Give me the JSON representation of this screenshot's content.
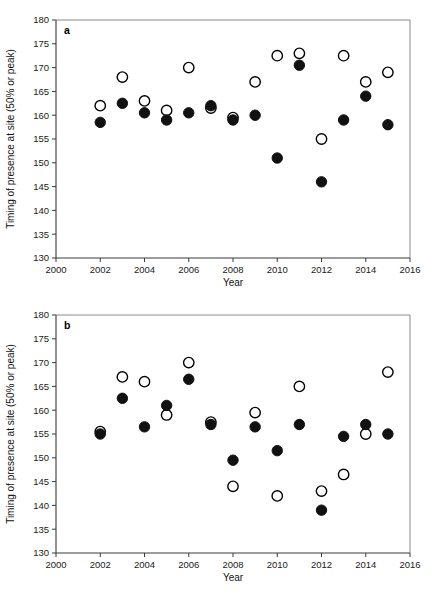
{
  "figure": {
    "width": 435,
    "height": 599,
    "background": "#ffffff",
    "marker_open_fill": "#ffffff",
    "marker_open_stroke": "#000000",
    "marker_filled_fill": "#111111"
  },
  "chart_data": [
    {
      "type": "scatter",
      "panel_label": "a",
      "title": "",
      "xlabel": "Year",
      "ylabel": "Timing of presence at site (50% or peak)",
      "xlim": [
        2000,
        2016
      ],
      "ylim": [
        130,
        180
      ],
      "xticks": [
        2000,
        2002,
        2004,
        2006,
        2008,
        2010,
        2012,
        2014,
        2016
      ],
      "yticks": [
        130,
        135,
        140,
        145,
        150,
        155,
        160,
        165,
        170,
        175,
        180
      ],
      "grid": false,
      "legend": "none",
      "x": [
        2002,
        2003,
        2004,
        2005,
        2006,
        2007,
        2008,
        2009,
        2010,
        2011,
        2012,
        2013,
        2014,
        2015
      ],
      "series": [
        {
          "name": "open-circle",
          "marker": "open",
          "values": [
            162,
            168,
            163,
            161,
            170,
            161.5,
            159.5,
            167,
            172.5,
            173,
            155,
            172.5,
            167,
            169
          ]
        },
        {
          "name": "filled-circle",
          "marker": "filled",
          "values": [
            158.5,
            162.5,
            160.5,
            159,
            160.5,
            162,
            159,
            160,
            151,
            170.5,
            146,
            159,
            164,
            158
          ]
        }
      ]
    },
    {
      "type": "scatter",
      "panel_label": "b",
      "title": "",
      "xlabel": "Year",
      "ylabel": "Timing of presence at site (50% or peak)",
      "xlim": [
        2000,
        2016
      ],
      "ylim": [
        130,
        180
      ],
      "xticks": [
        2000,
        2002,
        2004,
        2006,
        2008,
        2010,
        2012,
        2014,
        2016
      ],
      "yticks": [
        130,
        135,
        140,
        145,
        150,
        155,
        160,
        165,
        170,
        175,
        180
      ],
      "grid": false,
      "legend": "none",
      "x": [
        2002,
        2003,
        2004,
        2005,
        2006,
        2007,
        2008,
        2009,
        2010,
        2011,
        2012,
        2013,
        2014,
        2015
      ],
      "series": [
        {
          "name": "open-circle",
          "marker": "open",
          "values": [
            155.5,
            167,
            166,
            159,
            170,
            157.5,
            144,
            159.5,
            142,
            165,
            143,
            146.5,
            155,
            168
          ]
        },
        {
          "name": "filled-circle",
          "marker": "filled",
          "values": [
            155,
            162.5,
            156.5,
            161,
            166.5,
            157,
            149.5,
            156.5,
            151.5,
            157,
            139,
            154.5,
            157,
            155
          ]
        }
      ]
    }
  ]
}
